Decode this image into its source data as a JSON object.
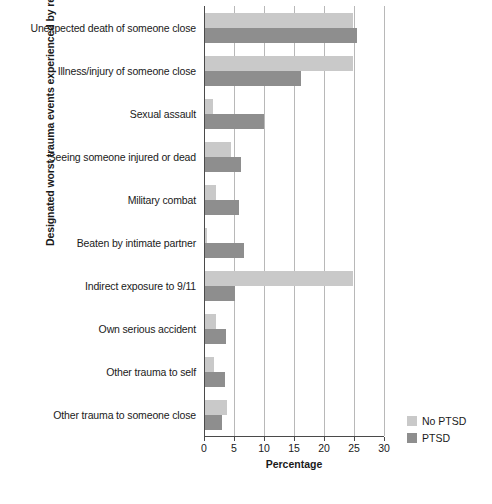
{
  "chart_data": {
    "type": "bar",
    "orientation": "horizontal",
    "title": "",
    "xlabel": "Percentage",
    "ylabel": "Designated worst trauma events experienced by respondents",
    "xlim": [
      0,
      30
    ],
    "xticks": [
      0,
      5,
      10,
      15,
      20,
      25,
      30
    ],
    "grid": true,
    "legend_position": "right-bottom",
    "categories": [
      "Unexpected death of someone close",
      "Illness/injury of someone close",
      "Sexual assault",
      "Seeing someone injured or dead",
      "Military combat",
      "Beaten by intimate partner",
      "Indirect exposure to 9/11",
      "Own serious accident",
      "Other trauma to self",
      "Other trauma to someone close"
    ],
    "series": [
      {
        "name": "No PTSD",
        "color": "#c9c9c9",
        "values": [
          24.7,
          24.7,
          1.3,
          4.3,
          1.8,
          0.3,
          24.7,
          1.8,
          1.5,
          3.7
        ]
      },
      {
        "name": "PTSD",
        "color": "#8e8e8e",
        "values": [
          25.3,
          16.0,
          9.8,
          6.0,
          5.6,
          6.5,
          5.0,
          3.5,
          3.3,
          2.8
        ]
      }
    ]
  },
  "axis": {
    "x_title": "Percentage",
    "y_title": "Designated worst trauma events experienced by respondents",
    "tick_labels": [
      "0",
      "5",
      "10",
      "15",
      "20",
      "25",
      "30"
    ]
  },
  "legend": {
    "items": [
      {
        "label": "No PTSD",
        "color": "#c9c9c9"
      },
      {
        "label": "PTSD",
        "color": "#8e8e8e"
      }
    ]
  }
}
